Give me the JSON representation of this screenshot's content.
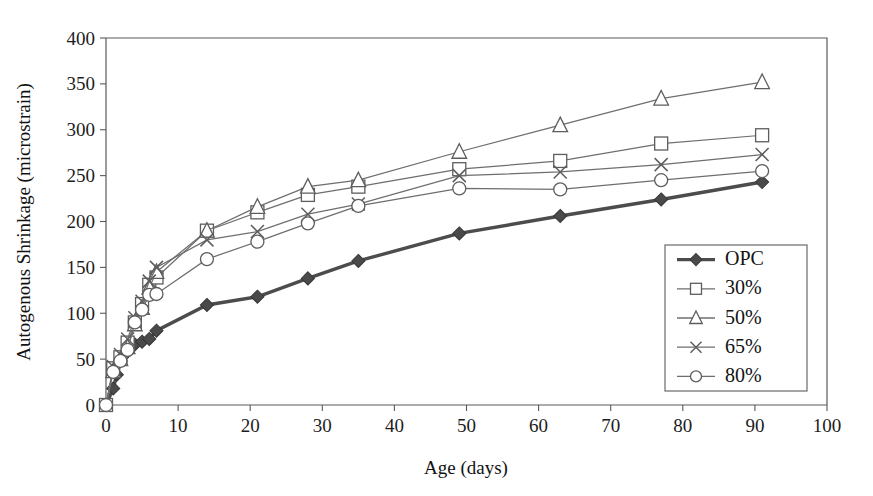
{
  "figure": {
    "background_color": "#ffffff",
    "plot_area": {
      "left": 106,
      "top": 38,
      "right": 827,
      "bottom": 405
    }
  },
  "chart_data": {
    "type": "line",
    "title": "",
    "subtitle": "",
    "xlabel": "Age (days)",
    "ylabel": "Autogenous Shrinkage (microstrain)",
    "xlim": [
      0,
      100
    ],
    "ylim": [
      0,
      400
    ],
    "xticks": [
      0,
      10,
      20,
      30,
      40,
      50,
      60,
      70,
      80,
      90,
      100
    ],
    "yticks": [
      0,
      50,
      100,
      150,
      200,
      250,
      300,
      350,
      400
    ],
    "xtick_labels": [
      "0",
      "10",
      "20",
      "30",
      "40",
      "50",
      "60",
      "70",
      "80",
      "90",
      "100"
    ],
    "ytick_labels": [
      "0",
      "50",
      "100",
      "150",
      "200",
      "250",
      "300",
      "350",
      "400"
    ],
    "grid": false,
    "legend_position": "lower-right",
    "series": [
      {
        "name": "OPC",
        "marker": "filled-diamond",
        "line_weight": "thick",
        "color": "#4c4c4c",
        "x": [
          0,
          1,
          1.5,
          2,
          3,
          4,
          5,
          6,
          7,
          14,
          21,
          28,
          35,
          49,
          63,
          77,
          91
        ],
        "y": [
          0,
          18,
          33,
          48,
          58,
          66,
          69,
          72,
          81,
          109,
          118,
          138,
          157,
          187,
          206,
          224,
          243
        ]
      },
      {
        "name": "30%",
        "marker": "open-square",
        "line_weight": "thin",
        "color": "#6e6e6e",
        "x": [
          0,
          1,
          2,
          3,
          4,
          5,
          6,
          7,
          14,
          21,
          28,
          35,
          49,
          63,
          77,
          91
        ],
        "y": [
          0,
          40,
          52,
          68,
          90,
          110,
          131,
          139,
          190,
          210,
          229,
          238,
          257,
          266,
          285,
          294
        ]
      },
      {
        "name": "50%",
        "marker": "open-triangle",
        "line_weight": "thin",
        "color": "#6e6e6e",
        "x": [
          0,
          1,
          2,
          3,
          4,
          5,
          6,
          7,
          14,
          21,
          28,
          35,
          49,
          63,
          77,
          91
        ],
        "y": [
          0,
          37,
          50,
          63,
          88,
          106,
          128,
          145,
          190,
          216,
          238,
          245,
          276,
          305,
          334,
          352
        ]
      },
      {
        "name": "65%",
        "marker": "cross",
        "line_weight": "thin",
        "color": "#6e6e6e",
        "x": [
          0,
          1,
          2,
          3,
          4,
          5,
          6,
          7,
          14,
          21,
          28,
          35,
          49,
          63,
          77,
          91
        ],
        "y": [
          0,
          42,
          55,
          72,
          95,
          113,
          135,
          150,
          180,
          189,
          208,
          219,
          250,
          254,
          262,
          273
        ]
      },
      {
        "name": "80%",
        "marker": "open-circle",
        "line_weight": "thin",
        "color": "#6e6e6e",
        "x": [
          0,
          1,
          2,
          3,
          4,
          5,
          6,
          7,
          14,
          21,
          28,
          35,
          49,
          63,
          77,
          91
        ],
        "y": [
          0,
          36,
          48,
          60,
          90,
          104,
          120,
          121,
          159,
          178,
          198,
          217,
          236,
          235,
          245,
          255
        ]
      }
    ]
  },
  "legend": {
    "entries": [
      {
        "label": "OPC",
        "marker": "filled-diamond",
        "weight": "thick"
      },
      {
        "label": "30%",
        "marker": "open-square",
        "weight": "thin"
      },
      {
        "label": "50%",
        "marker": "open-triangle",
        "weight": "thin"
      },
      {
        "label": "65%",
        "marker": "cross",
        "weight": "thin"
      },
      {
        "label": "80%",
        "marker": "open-circle",
        "weight": "thin"
      }
    ],
    "box": {
      "x": 665,
      "y": 245,
      "width": 142,
      "height": 146
    }
  }
}
